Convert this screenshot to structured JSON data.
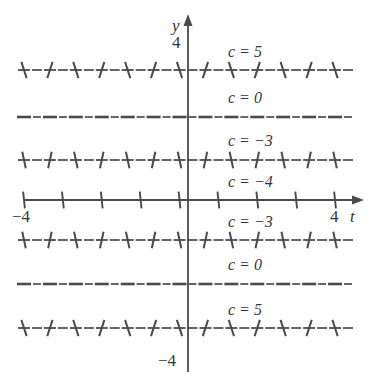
{
  "figure": {
    "background_color": "#ffffff",
    "ink_color": "#4a4a50",
    "text_color": "#35353a"
  },
  "axes": {
    "x_axis": {
      "name": "t",
      "label": "t",
      "min_tick_label": "-4",
      "max_tick_label": "4",
      "pixel_y": 200,
      "pixel_x_start": 24,
      "pixel_x_end": 358,
      "arrow": "right"
    },
    "y_axis": {
      "name": "y",
      "label": "y",
      "max_tick_label": "4",
      "min_tick_label": "-4",
      "pixel_x": 188,
      "pixel_y_start": 20,
      "pixel_y_end": 372,
      "arrow": "up"
    }
  },
  "chart_data": {
    "type": "line",
    "title": "",
    "xlabel": "t",
    "ylabel": "y",
    "xlim": [
      -4,
      4
    ],
    "ylim": [
      -4,
      4
    ],
    "grid": false,
    "legend": "inline-labels",
    "x_ticks": [
      -4,
      -3,
      -2,
      -1,
      0,
      1,
      2,
      3,
      4
    ],
    "x_tick_labels": [
      "-4",
      "",
      "",
      "",
      "",
      "",
      "",
      "",
      "4"
    ],
    "y_tick_labels": [
      "4",
      "-4"
    ],
    "series": [
      {
        "name": "c = 5",
        "label": "c = 5",
        "y_value": 3.0,
        "pixel_y": 70,
        "label_pixel_x": 228,
        "label_pixel_y": 52,
        "style": "dashed-with-steep-ticks",
        "tilt_deg": 72
      },
      {
        "name": "c = 0",
        "label": "c = 0",
        "y_value": 1.9,
        "pixel_y": 117,
        "label_pixel_x": 228,
        "label_pixel_y": 98,
        "style": "dashed-flat",
        "tilt_deg": 0
      },
      {
        "name": "c = -3",
        "label": "c = −3",
        "y_value": 0.95,
        "pixel_y": 160,
        "label_pixel_x": 228,
        "label_pixel_y": 141,
        "style": "dashed-with-steep-ticks",
        "tilt_deg": 78
      },
      {
        "name": "c = -4",
        "label": "c = −4",
        "y_value": 0.0,
        "pixel_y": 200,
        "label_pixel_x": 228,
        "label_pixel_y": 182,
        "style": "solid-with-vertical-ticks",
        "tilt_deg": 84
      },
      {
        "name": "c = -3 (lower)",
        "label": "c = −3",
        "y_value": -0.95,
        "pixel_y": 240,
        "label_pixel_x": 228,
        "label_pixel_y": 222,
        "style": "dashed-with-steep-ticks",
        "tilt_deg": 78
      },
      {
        "name": "c = 0 (lower)",
        "label": "c = 0",
        "y_value": -1.9,
        "pixel_y": 284,
        "label_pixel_x": 228,
        "label_pixel_y": 265,
        "style": "dashed-flat",
        "tilt_deg": 0
      },
      {
        "name": "c = 5 (lower)",
        "label": "c = 5",
        "y_value": -3.0,
        "pixel_y": 328,
        "label_pixel_x": 228,
        "label_pixel_y": 310,
        "style": "dashed-with-steep-ticks",
        "tilt_deg": 72
      }
    ]
  },
  "labels": {
    "y_axis_name": "y",
    "y_axis_top_tick": "4",
    "y_axis_bottom_tick": "−4",
    "x_axis_name": "t",
    "x_axis_left_tick": "−4",
    "x_axis_right_tick": "4",
    "curve_c5_top": "c = 5",
    "curve_c0_top": "c = 0",
    "curve_cm3_top": "c = −3",
    "curve_cm4": "c = −4",
    "curve_cm3_bottom": "c = −3",
    "curve_c0_bottom": "c = 0",
    "curve_c5_bottom": "c = 5"
  }
}
